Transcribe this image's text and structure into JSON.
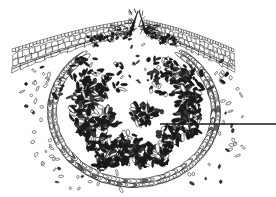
{
  "figure": {
    "title": "Cross-section of a fungal acervulus erupting through host epidermis",
    "type": "scientific-line-drawing",
    "medium": "pen-and-ink stipple line art",
    "background_color": "#ffffff",
    "ink_color": "#1a1a1a",
    "canvas": {
      "width": 276,
      "height": 197
    }
  },
  "structures": {
    "epidermis_left": {
      "label": "host epidermis flap (left)",
      "description": "torn band of epidermal tissue lifted upward toward the centre",
      "outer_row_cells": 40,
      "inner_cells": 90,
      "span_x": [
        12,
        132
      ],
      "span_y": [
        18,
        72
      ],
      "tip_x": 132,
      "tip_y": 20
    },
    "epidermis_right": {
      "label": "host epidermis flap (right)",
      "description": "mirrored torn band of epidermal tissue lifted upward toward the centre",
      "outer_row_cells": 40,
      "inner_cells": 90,
      "span_x": [
        144,
        234
      ],
      "span_y": [
        18,
        72
      ],
      "tip_x": 144,
      "tip_y": 20
    },
    "ostiole": {
      "label": "central rupture / ostiole",
      "description": "V-shaped split between the two raised epidermal flaps through which spores escape",
      "apex_x": 138,
      "apex_y": 12,
      "mouth_width": 26
    },
    "cavity_wall": {
      "label": "basal stroma wall of elongated cells",
      "description": "rounded cup of narrow elongate pseudoparenchymatous cells forming the cavity boundary",
      "centre_x": 134,
      "centre_y": 112,
      "radius_x": 84,
      "radius_y": 73,
      "cell_count": 120,
      "layers": 2
    },
    "conidiophore_tufts": {
      "label": "tufts of conidiophores bearing conidia",
      "description": "dense radiating brush-like clusters of filaments with attached club and oval conidia",
      "tuft_count": 14,
      "filaments_per_tuft": 11,
      "conidia_per_tuft": 26
    },
    "free_spores": {
      "label": "free conidia (spores) dispersed outside the wall",
      "description": "scattered small oval and elliptical spores outside the ruptured fruiting body",
      "count": 70
    }
  },
  "annotations": {
    "leader_line": {
      "name": "pointer leader line",
      "text": "",
      "has_text_label": false,
      "start_x": 160,
      "start_y": 124,
      "end_x": 276,
      "end_y": 124,
      "stroke_width": 1.6,
      "color": "#1a1a1a"
    }
  },
  "palette": {
    "ink": "#1a1a1a",
    "ink_mid": "#3b3b3b",
    "ink_light": "#6a6a6a",
    "paper": "#ffffff"
  }
}
